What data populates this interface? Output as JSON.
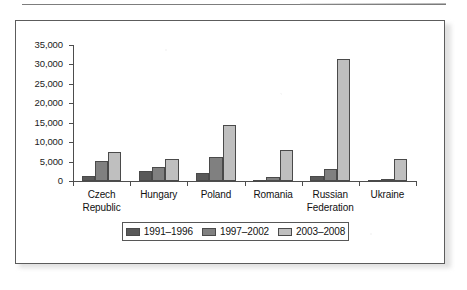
{
  "figure": {
    "border_color": "#5c5c5c",
    "background": "#ffffff"
  },
  "chart_data": {
    "type": "bar",
    "title": "",
    "subtitle": "",
    "xlabel": "",
    "ylabel": "",
    "categories": [
      "Czech Republic",
      "Hungary",
      "Poland",
      "Romania",
      "Russian Federation",
      "Ukraine"
    ],
    "category_lines": [
      [
        "Czech",
        "Republic"
      ],
      [
        "Hungary"
      ],
      [
        "Poland"
      ],
      [
        "Romania"
      ],
      [
        "Russian",
        "Federation"
      ],
      [
        "Ukraine"
      ]
    ],
    "series": [
      {
        "name": "1991–1996",
        "color": "#595959",
        "values": [
          1400,
          2500,
          2100,
          100,
          1250,
          150
        ]
      },
      {
        "name": "1997–2002",
        "color": "#808080",
        "values": [
          5100,
          3500,
          6200,
          1100,
          3000,
          450
        ]
      },
      {
        "name": "2003–2008",
        "color": "#bfbfbf",
        "values": [
          7400,
          5700,
          14300,
          8000,
          31500,
          5700
        ]
      }
    ],
    "ylim": [
      0,
      35000
    ],
    "ytick_values": [
      0,
      5000,
      10000,
      15000,
      20000,
      25000,
      30000,
      35000
    ],
    "ytick_labels": [
      "0",
      "5,000",
      "10,000",
      "15,000",
      "20,000",
      "25,000",
      "30,000",
      "35,000"
    ],
    "grid": false,
    "legend_position": "bottom",
    "legend_entries": [
      "1991–1996",
      "1997–2002",
      "2003–2008"
    ]
  }
}
